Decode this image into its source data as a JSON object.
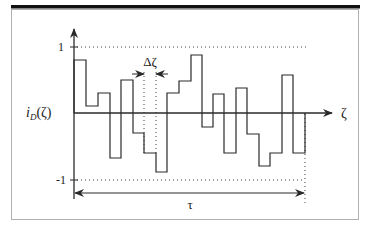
{
  "diagram": {
    "y_label": "i_D(ζ)",
    "y_label_main": "i",
    "y_label_sub": "D",
    "y_label_arg": "(ζ)",
    "x_label": "ζ",
    "tick_top": "1",
    "tick_bottom": "-1",
    "delta_label": "Δζ",
    "period_label": "τ",
    "colors": {
      "line": "#2a2a2a",
      "frame": "#b0b0b0",
      "bar": "#111111"
    },
    "steps": [
      {
        "x0": 74,
        "x1": 86,
        "y": 60
      },
      {
        "x0": 86,
        "x1": 98,
        "y": 106
      },
      {
        "x0": 98,
        "x1": 110,
        "y": 93
      },
      {
        "x0": 110,
        "x1": 121,
        "y": 158
      },
      {
        "x0": 121,
        "x1": 133,
        "y": 80
      },
      {
        "x0": 133,
        "x1": 144,
        "y": 133
      },
      {
        "x0": 144,
        "x1": 156,
        "y": 153
      },
      {
        "x0": 156,
        "x1": 167,
        "y": 172
      },
      {
        "x0": 167,
        "x1": 179,
        "y": 93
      },
      {
        "x0": 179,
        "x1": 191,
        "y": 81
      },
      {
        "x0": 191,
        "x1": 202,
        "y": 55
      },
      {
        "x0": 202,
        "x1": 213,
        "y": 127
      },
      {
        "x0": 213,
        "x1": 224,
        "y": 94
      },
      {
        "x0": 224,
        "x1": 236,
        "y": 153
      },
      {
        "x0": 236,
        "x1": 247,
        "y": 88
      },
      {
        "x0": 247,
        "x1": 259,
        "y": 134
      },
      {
        "x0": 259,
        "x1": 270,
        "y": 166
      },
      {
        "x0": 270,
        "x1": 282,
        "y": 153
      },
      {
        "x0": 282,
        "x1": 293,
        "y": 75
      },
      {
        "x0": 293,
        "x1": 305,
        "y": 153
      }
    ]
  }
}
